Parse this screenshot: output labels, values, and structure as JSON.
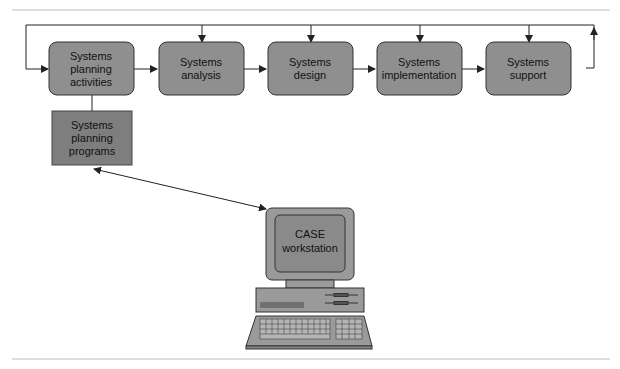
{
  "diagram": {
    "phases": [
      {
        "id": "planning",
        "lines": [
          "Systems",
          "planning",
          "activities"
        ]
      },
      {
        "id": "analysis",
        "lines": [
          "Systems",
          "analysis"
        ]
      },
      {
        "id": "design",
        "lines": [
          "Systems",
          "design"
        ]
      },
      {
        "id": "implementation",
        "lines": [
          "Systems",
          "implementation"
        ]
      },
      {
        "id": "support",
        "lines": [
          "Systems",
          "support"
        ]
      }
    ],
    "programs_box": {
      "lines": [
        "Systems",
        "planning",
        "programs"
      ]
    },
    "workstation": {
      "lines": [
        "CASE",
        "workstation"
      ]
    },
    "colors": {
      "phase_fill": "#8f8f8f",
      "programs_fill": "#7e7e7e",
      "computer_fill": "#9a9a9a",
      "line": "#222222",
      "rule": "#bdbdbd"
    }
  }
}
